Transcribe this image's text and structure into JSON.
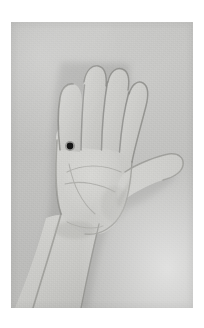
{
  "page": {
    "background_color": "#ffffff",
    "width": 204,
    "height": 328
  },
  "photo": {
    "name": "hand-photograph",
    "caption": "",
    "description": "Black-and-white photograph of a left hand held up with the palm facing the camera, fingers together and thumb extended to the right, forearm descending to the lower-left corner.",
    "frame": {
      "left": 11,
      "top": 22,
      "width": 182,
      "height": 286
    },
    "tone": {
      "background_gray": "#c6c6c4",
      "skin_gray": "#d2d2cf",
      "shadow_gray": "#9a9a98",
      "outline_gray": "#6f6f6d"
    },
    "subject": {
      "name": "hand",
      "orientation": "palm-facing, fingers up, thumb to the right",
      "fingers": [
        "index",
        "middle",
        "ring",
        "little"
      ],
      "thumb": "extended right"
    },
    "marker": {
      "name": "palm-dot-marker",
      "label": "",
      "color": "#141414",
      "center_x": 70,
      "center_y": 146,
      "radius": 3.4,
      "location": "palm, below the index finger base"
    }
  }
}
